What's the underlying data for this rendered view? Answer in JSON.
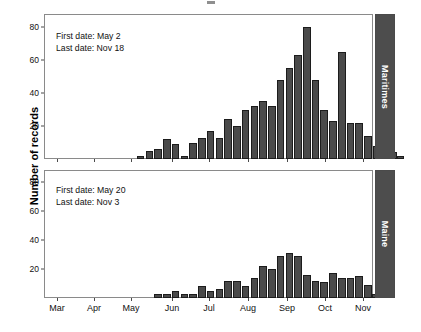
{
  "figure": {
    "y_axis_title": "Number of records",
    "bar_color": "#4a4a4a",
    "bar_edge_color": "#1c1c1c",
    "strip_color": "#4d4d4d",
    "strip_text_color": "#ffffff",
    "panel_border_color": "#8a8a8a",
    "background": "#ffffff"
  },
  "panels": [
    {
      "strip_label": "Maritimes",
      "annotation": {
        "first_date_line": "First date: May 2",
        "last_date_line": "Last date: Nov 18"
      }
    },
    {
      "strip_label": "Maine",
      "annotation": {
        "first_date_line": "First date: May 20",
        "last_date_line": "Last date: Nov 3"
      }
    }
  ],
  "x_ticks": [
    {
      "label": "Mar",
      "pos": 57
    },
    {
      "label": "Apr",
      "pos": 94
    },
    {
      "label": "May",
      "pos": 131
    },
    {
      "label": "Jun",
      "pos": 172
    },
    {
      "label": "Jul",
      "pos": 209
    },
    {
      "label": "Aug",
      "pos": 248
    },
    {
      "label": "Sep",
      "pos": 287
    },
    {
      "label": "Oct",
      "pos": 325
    },
    {
      "label": "Nov",
      "pos": 363
    }
  ],
  "y_ticks": [
    20,
    40,
    60,
    80
  ],
  "chart_data": [
    {
      "type": "bar",
      "title": "Maritimes",
      "xlabel": "",
      "ylabel": "Number of records",
      "ylim": [
        0,
        88
      ],
      "xlim_months": [
        "Mar",
        "Nov"
      ],
      "grid": false,
      "legend": "none",
      "annotations": [
        "First date: May 2",
        "Last date: Nov 18"
      ],
      "bin": "weekly",
      "categories": [
        "May 07",
        "May 14",
        "May 21",
        "May 28",
        "Jun 04",
        "Jun 11",
        "Jun 18",
        "Jun 25",
        "Jul 02",
        "Jul 09",
        "Jul 16",
        "Jul 23",
        "Jul 30",
        "Aug 06",
        "Aug 13",
        "Aug 20",
        "Aug 27",
        "Sep 03",
        "Sep 10",
        "Sep 17",
        "Sep 24",
        "Oct 01",
        "Oct 08",
        "Oct 15",
        "Oct 22",
        "Oct 29",
        "Nov 05",
        "Nov 12",
        "Nov 19"
      ],
      "values": [
        2,
        5,
        6,
        12,
        9,
        2,
        10,
        13,
        17,
        13,
        24,
        20,
        30,
        32,
        35,
        32,
        48,
        55,
        63,
        80,
        48,
        30,
        23,
        65,
        22,
        22,
        14,
        8,
        6
      ],
      "extra_tail": [
        4,
        2
      ]
    },
    {
      "type": "bar",
      "title": "Maine",
      "xlabel": "",
      "ylabel": "Number of records",
      "ylim": [
        0,
        88
      ],
      "xlim_months": [
        "Mar",
        "Nov"
      ],
      "grid": false,
      "legend": "none",
      "annotations": [
        "First date: May 20",
        "Last date: Nov 3"
      ],
      "bin": "weekly",
      "categories": [
        "May 21",
        "May 28",
        "Jun 04",
        "Jun 11",
        "Jun 18",
        "Jun 25",
        "Jul 02",
        "Jul 09",
        "Jul 16",
        "Jul 23",
        "Jul 30",
        "Aug 06",
        "Aug 13",
        "Aug 20",
        "Aug 27",
        "Sep 03",
        "Sep 10",
        "Sep 17",
        "Sep 24",
        "Oct 01",
        "Oct 08",
        "Oct 15",
        "Oct 22",
        "Oct 29",
        "Nov 05"
      ],
      "values": [
        3,
        3,
        5,
        3,
        3,
        8,
        5,
        6,
        12,
        12,
        8,
        14,
        22,
        20,
        29,
        31,
        29,
        16,
        12,
        11,
        17,
        14,
        14,
        15,
        9
      ],
      "extra_tail": [
        3,
        4
      ]
    }
  ]
}
